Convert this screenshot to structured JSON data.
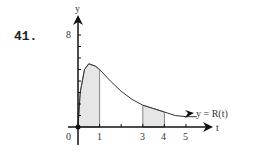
{
  "problem_number": "41.",
  "chart_data": {
    "type": "area",
    "title": "",
    "xlabel": "t",
    "ylabel": "y",
    "curve_label": "y = R(t)",
    "x_ticks": [
      "0",
      "1",
      "3",
      "4",
      "5"
    ],
    "y_ticks": [
      "8"
    ],
    "xlim": [
      0,
      5.5
    ],
    "ylim": [
      0,
      9
    ],
    "grid": false,
    "series": [
      {
        "name": "y = R(t)",
        "x": [
          0,
          0.1,
          0.3,
          0.5,
          0.8,
          1,
          1.5,
          2,
          2.5,
          3,
          3.5,
          4,
          4.5,
          5,
          5.5
        ],
        "values": [
          0,
          3.0,
          5.0,
          5.5,
          5.3,
          5.0,
          4.0,
          3.1,
          2.4,
          1.9,
          1.6,
          1.3,
          1.0,
          0.9,
          0.9
        ]
      }
    ],
    "shaded_regions": [
      {
        "from": 0,
        "to": 1
      },
      {
        "from": 3,
        "to": 4
      }
    ]
  }
}
